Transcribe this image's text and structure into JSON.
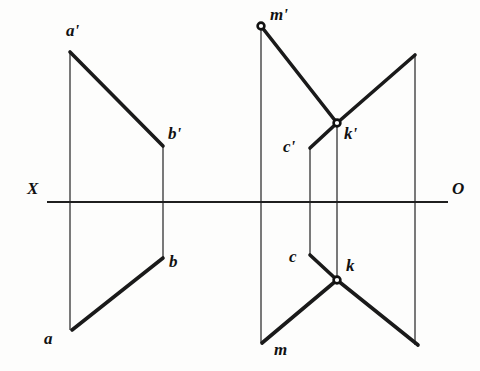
{
  "figure": {
    "background_color": "#fdfdfc",
    "ink_color": "#111111",
    "width": 480,
    "height": 371
  },
  "axis": {
    "name": "ground-line",
    "left_label": "X",
    "right_label": "O",
    "y": 202,
    "x_start": 47,
    "x_end": 448,
    "left_label_pos": {
      "x": 27,
      "y": 180
    },
    "right_label_pos": {
      "x": 452,
      "y": 180
    }
  },
  "left_figure": {
    "name": "line-ab-projections",
    "projection_lines": [
      {
        "name": "projector-a",
        "x": 70,
        "y_top": 52,
        "y_bottom": 330
      },
      {
        "name": "projector-b",
        "x": 163,
        "y_top": 146,
        "y_bottom": 258
      }
    ],
    "segments": [
      {
        "name": "segment-a-prime-b-prime",
        "x1": 70,
        "y1": 52,
        "x2": 163,
        "y2": 146
      },
      {
        "name": "segment-a-b",
        "x1": 72,
        "y1": 330,
        "x2": 163,
        "y2": 258
      }
    ],
    "points": [
      {
        "id": "a-prime",
        "label": "a'",
        "x": 70,
        "y": 52,
        "label_x": 66,
        "label_y": 22,
        "dot": false
      },
      {
        "id": "b-prime",
        "label": "b'",
        "x": 163,
        "y": 146,
        "label_x": 168,
        "label_y": 125,
        "dot": false
      },
      {
        "id": "b",
        "label": "b",
        "x": 163,
        "y": 258,
        "label_x": 169,
        "label_y": 253,
        "dot": false
      },
      {
        "id": "a",
        "label": "a",
        "x": 72,
        "y": 330,
        "label_x": 44,
        "label_y": 330,
        "dot": false
      }
    ]
  },
  "right_figure": {
    "name": "line-mk-projections",
    "projection_lines": [
      {
        "name": "projector-m",
        "x": 261,
        "y_top": 26,
        "y_bottom": 343
      },
      {
        "name": "projector-c",
        "x": 310,
        "y_top": 148,
        "y_bottom": 255
      },
      {
        "name": "projector-k",
        "x": 337,
        "y_top": 123,
        "y_bottom": 280
      },
      {
        "name": "projector-right-edge",
        "x": 415,
        "y_top": 55,
        "y_bottom": 345
      }
    ],
    "segments": [
      {
        "name": "segment-m-prime-k-prime",
        "x1": 261,
        "y1": 26,
        "x2": 337,
        "y2": 123
      },
      {
        "name": "segment-k-prime-right",
        "x1": 337,
        "y1": 123,
        "x2": 415,
        "y2": 55
      },
      {
        "name": "segment-c-prime-k-prime",
        "x1": 310,
        "y1": 148,
        "x2": 337,
        "y2": 123
      },
      {
        "name": "segment-m-k",
        "x1": 262,
        "y1": 343,
        "x2": 337,
        "y2": 280
      },
      {
        "name": "segment-k-right",
        "x1": 337,
        "y1": 280,
        "x2": 418,
        "y2": 345
      },
      {
        "name": "segment-c-k",
        "x1": 310,
        "y1": 255,
        "x2": 337,
        "y2": 280
      }
    ],
    "points": [
      {
        "id": "m-prime",
        "label": "m'",
        "x": 261,
        "y": 26,
        "label_x": 270,
        "label_y": 6,
        "dot": true
      },
      {
        "id": "k-prime",
        "label": "k'",
        "x": 337,
        "y": 123,
        "label_x": 344,
        "label_y": 125,
        "dot": true
      },
      {
        "id": "c-prime",
        "label": "c'",
        "x": 310,
        "y": 148,
        "label_x": 283,
        "label_y": 138,
        "dot": false
      },
      {
        "id": "c",
        "label": "c",
        "x": 310,
        "y": 255,
        "label_x": 289,
        "label_y": 248,
        "dot": false
      },
      {
        "id": "k",
        "label": "k",
        "x": 337,
        "y": 280,
        "label_x": 346,
        "label_y": 257,
        "dot": true
      },
      {
        "id": "m",
        "label": "m",
        "x": 262,
        "y": 343,
        "label_x": 274,
        "label_y": 341,
        "dot": false
      }
    ]
  }
}
